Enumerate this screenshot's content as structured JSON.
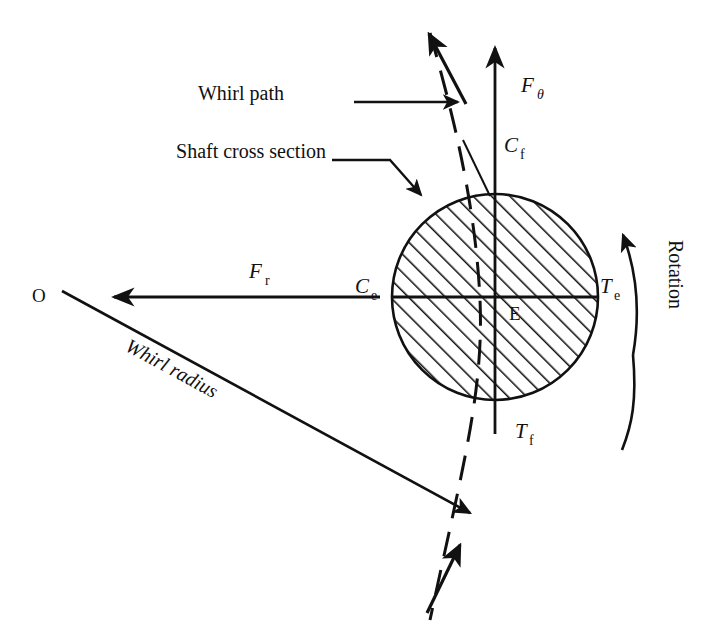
{
  "figure": {
    "background_color": "#ffffff",
    "line_color": "#111111",
    "labels": {
      "whirl_path": "Whirl path",
      "shaft_cross_section": "Shaft cross section",
      "rotation": "Rotation",
      "whirl_radius": "Whirl radius",
      "origin_point": "O",
      "centre_point": "E",
      "force_theta_symbol": "F",
      "force_theta_subscript": "θ",
      "force_radial_symbol": "F",
      "force_radial_subscript": "r",
      "cf_symbol": "C",
      "cf_subscript": "f",
      "ce_symbol": "C",
      "ce_subscript": "e",
      "te_symbol": "T",
      "te_subscript": "e",
      "tf_symbol": "T",
      "tf_subscript": "f"
    },
    "geometry": {
      "circle_center_x": 495,
      "circle_center_y": 297,
      "circle_radius": 103,
      "hatch_angle_deg": 45,
      "hatch_spacing_px": 13
    }
  }
}
